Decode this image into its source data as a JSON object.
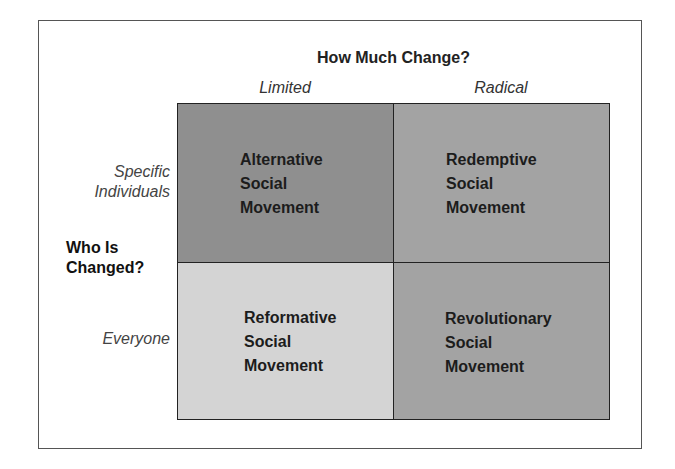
{
  "diagram": {
    "title": "How Much Change?",
    "columns": [
      "Limited",
      "Radical"
    ],
    "row_axis_label_line1": "Who Is",
    "row_axis_label_line2": "Changed?",
    "rows": [
      {
        "line1": "Specific",
        "line2": "Individuals"
      },
      {
        "line1": "Everyone"
      }
    ],
    "cells": [
      {
        "row": "Specific Individuals",
        "col": "Limited",
        "lines": [
          "Alternative",
          "Social",
          "Movement"
        ],
        "color": "#8f8f8f"
      },
      {
        "row": "Specific Individuals",
        "col": "Radical",
        "lines": [
          "Redemptive",
          "Social",
          "Movement"
        ],
        "color": "#a3a3a3"
      },
      {
        "row": "Everyone",
        "col": "Limited",
        "lines": [
          "Reformative",
          "Social",
          "Movement"
        ],
        "color": "#d4d4d4"
      },
      {
        "row": "Everyone",
        "col": "Radical",
        "lines": [
          "Revolutionary",
          "Social",
          "Movement"
        ],
        "color": "#a3a3a3"
      }
    ]
  }
}
